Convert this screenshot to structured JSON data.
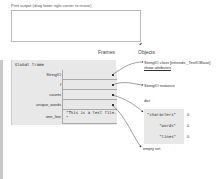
{
  "print_output": {
    "label": "Print output (drag lower right corner to resize)",
    "content": "",
    "resize_glyph": "⬋"
  },
  "headers": {
    "frames": "Frames",
    "objects": "Objects"
  },
  "frame": {
    "title": "Global frame",
    "rows": [
      {
        "name": "StringIO",
        "value": "",
        "pointer": true
      },
      {
        "name": "f",
        "value": "",
        "pointer": true
      },
      {
        "name": "counts",
        "value": "",
        "pointer": true
      },
      {
        "name": "unique_words",
        "value": "",
        "pointer": true
      },
      {
        "name": "one_line",
        "value_line1": "\"This is a test file.",
        "value_line2": "\"",
        "pointer": false
      }
    ]
  },
  "objects": {
    "stringio_class": "StringIO class [extends _TextIOBase]",
    "show_attributes": "show attributes",
    "stringio_instance": "StringIO instance",
    "dict_label": "dict",
    "dict_entries": [
      {
        "key": "\"characters\"",
        "value": "0"
      },
      {
        "key": "\"words\"",
        "value": "0"
      },
      {
        "key": "\"lines\"",
        "value": "0"
      }
    ],
    "empty_set": "empty set"
  }
}
